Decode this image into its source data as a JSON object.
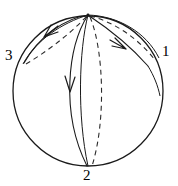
{
  "figure": {
    "background_color": "#ffffff",
    "stroke_color": "#1a1a1a",
    "dashed_stroke_color": "#333333",
    "width": 178,
    "height": 186
  },
  "sphere": {
    "name": "outline-circle",
    "center_x": 88,
    "center_y": 91,
    "radius": 75,
    "stroke_width": 1.2
  },
  "vertices": [
    {
      "id": "1",
      "label": "1",
      "x": 163,
      "y": 60,
      "label_x": 162,
      "label_y": 44
    },
    {
      "id": "2",
      "label": "2",
      "x": 88,
      "y": 166,
      "label_x": 83,
      "label_y": 168
    },
    {
      "id": "3",
      "label": "3",
      "x": 24,
      "y": 63,
      "label_x": 5,
      "label_y": 48
    },
    {
      "id": "pole",
      "label": "",
      "x": 88,
      "y": 15,
      "label_x": 0,
      "label_y": 0
    }
  ],
  "arcs": [
    {
      "name": "arc-pole-to-3-front",
      "style": "solid",
      "path": "M 88 15 C 66 18, 39 36, 24 63",
      "arrow": {
        "x": 49,
        "y": 32,
        "angle": 220
      }
    },
    {
      "name": "arc-pole-to-3-back",
      "style": "dashed",
      "path": "M 88 15 C 70 27, 44 47, 24 63",
      "arrow": null
    },
    {
      "name": "arc-pole-to-1-front",
      "style": "solid",
      "path": "M 88 15 C 104 24, 128 41, 149 65",
      "arrow": {
        "x": 122,
        "y": 45,
        "angle": 42
      }
    },
    {
      "name": "arc-pole-to-1-back",
      "style": "dashed",
      "path": "M 88 15 C 112 18, 140 34, 156 57",
      "arrow": null
    },
    {
      "name": "arc-1-rim-to-pole",
      "style": "solid",
      "path": "M 88 15 C 118 16, 146 32, 160 58",
      "arrow": null
    },
    {
      "name": "arc-pole-to-2-front",
      "style": "solid",
      "path": "M 88 15 C 70 45, 62 110, 88 166",
      "arrow": {
        "x": 70,
        "y": 86,
        "angle": 100
      }
    },
    {
      "name": "arc-pole-to-2-back",
      "style": "dashed",
      "path": "M 88 15 C 104 48, 106 120, 91 166",
      "arrow": null
    },
    {
      "name": "arc-2-limb-front",
      "style": "solid",
      "path": "M 88 15 C 80 50, 78 115, 88 166",
      "arrow": null
    },
    {
      "name": "arc-1-terminus-tail",
      "style": "solid",
      "path": "M 149 65 C 155 75, 158 85, 160 95",
      "arrow": null
    }
  ],
  "labels": {
    "one": "1",
    "two": "2",
    "three": "3"
  }
}
